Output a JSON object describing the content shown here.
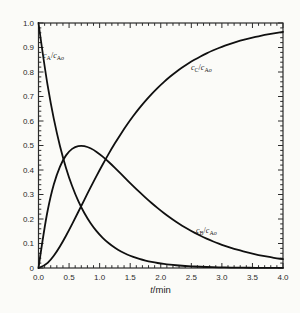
{
  "page": {
    "background": "#fbfbf8"
  },
  "chart": {
    "frame_color": "#2b2b2b",
    "curve_color": "#101010",
    "text_color": "#2b2b2b",
    "x_tick_labels": [
      "0.0",
      "0.5",
      "1.0",
      "1.5",
      "2.0",
      "2.5",
      "3.0",
      "3.5",
      "4.0"
    ],
    "y_tick_labels": [
      "1.0",
      "0.9",
      "0.8",
      "0.7",
      "0.6",
      "0.5",
      "0.4",
      "0.3",
      "0.2",
      "0.1",
      "0"
    ],
    "x_axis_label": {
      "variable": "t",
      "unit": "/min"
    },
    "curve_labels": {
      "A": {
        "c1": "c",
        "s1": "A",
        "slash": "/",
        "c2": "c",
        "s2": "A",
        "s2o": "o"
      },
      "B": {
        "c1": "c",
        "s1": "B",
        "slash": "/",
        "c2": "c",
        "s2": "A",
        "s2o": "o"
      },
      "C": {
        "c1": "c",
        "s1": "C",
        "slash": "/",
        "c2": "c",
        "s2": "A",
        "s2o": "o"
      }
    }
  },
  "chart_data": {
    "type": "line",
    "title": "",
    "xlabel": "t/min",
    "ylabel": "",
    "xlim": [
      0,
      4
    ],
    "ylim": [
      0,
      1
    ],
    "x_major_step": 0.5,
    "x_minor_step": 0.1,
    "y_major_step": 0.1,
    "y_minor_step": 0.02,
    "grid": false,
    "legend": "none (inline curve labels)",
    "x": [
      0,
      0.1,
      0.2,
      0.3,
      0.4,
      0.5,
      0.6,
      0.7,
      0.8,
      0.9,
      1,
      1.1,
      1.2,
      1.3,
      1.4,
      1.5,
      1.6,
      1.7,
      1.8,
      1.9,
      2,
      2.1,
      2.2,
      2.3,
      2.4,
      2.5,
      2.6,
      2.7,
      2.8,
      2.9,
      3,
      3.1,
      3.2,
      3.3,
      3.4,
      3.5,
      3.6,
      3.7,
      3.8,
      3.9,
      4
    ],
    "series": [
      {
        "name": "cA/cAo",
        "values": [
          1,
          0.8187,
          0.6703,
          0.5488,
          0.4493,
          0.3679,
          0.3012,
          0.2466,
          0.2019,
          0.1653,
          0.1353,
          0.1108,
          0.0907,
          0.0743,
          0.0608,
          0.0498,
          0.0408,
          0.0334,
          0.0273,
          0.0224,
          0.0183,
          0.015,
          0.0123,
          0.0101,
          0.0082,
          0.0067,
          0.0055,
          0.0045,
          0.0037,
          0.003,
          0.0025,
          0.002,
          0.0017,
          0.0014,
          0.0011,
          0.0009,
          0.0007,
          0.0006,
          0.0005,
          0.0004,
          0.0003
        ]
      },
      {
        "name": "cB/cAo",
        "values": [
          0,
          0.1722,
          0.2968,
          0.384,
          0.442,
          0.4773,
          0.4952,
          0.5,
          0.4947,
          0.4826,
          0.4651,
          0.4442,
          0.4209,
          0.3965,
          0.3716,
          0.3466,
          0.3223,
          0.2986,
          0.276,
          0.2545,
          0.234,
          0.215,
          0.197,
          0.1804,
          0.165,
          0.1508,
          0.1376,
          0.1254,
          0.1142,
          0.104,
          0.0946,
          0.086,
          0.0782,
          0.071,
          0.0646,
          0.0586,
          0.0532,
          0.0482,
          0.0438,
          0.0396,
          0.036
        ]
      },
      {
        "name": "cC/cAo",
        "values": [
          0,
          0.0091,
          0.0329,
          0.0672,
          0.1087,
          0.1548,
          0.2036,
          0.2534,
          0.3034,
          0.3521,
          0.3996,
          0.445,
          0.4884,
          0.5292,
          0.5676,
          0.6036,
          0.6369,
          0.668,
          0.6967,
          0.7231,
          0.7477,
          0.77,
          0.7907,
          0.8095,
          0.8268,
          0.8425,
          0.8569,
          0.8701,
          0.8821,
          0.893,
          0.9029,
          0.912,
          0.9201,
          0.9276,
          0.9343,
          0.9405,
          0.9461,
          0.9512,
          0.9557,
          0.96,
          0.9637
        ]
      }
    ],
    "annotations": [
      {
        "label": "cA/cAo",
        "x": 0.12,
        "y": 0.86
      },
      {
        "label": "cC/cAo",
        "x": 2.55,
        "y": 0.81
      },
      {
        "label": "cB/cAo",
        "x": 2.62,
        "y": 0.145
      }
    ]
  }
}
